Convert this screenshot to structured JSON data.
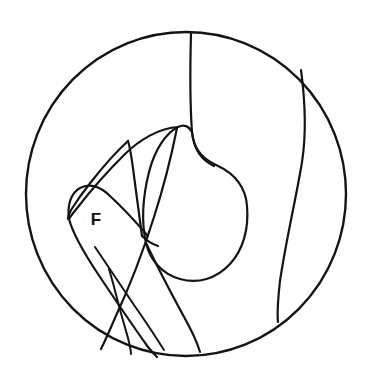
{
  "figure": {
    "type": "line-diagram",
    "background_color": "#ffffff",
    "stroke_color": "#141414",
    "canvas": {
      "width": 374,
      "height": 375
    }
  },
  "boundary": {
    "name": "field-of-view-circle",
    "shape": "ellipse",
    "center_x": 186,
    "center_y": 194,
    "radius_x": 160,
    "radius_y": 162,
    "stroke_width": 2.4
  },
  "labels": [
    {
      "id": "label-f",
      "text": "F",
      "x": 96,
      "y": 221,
      "font_size": 17,
      "font_weight": "bold",
      "color": "#111111"
    }
  ],
  "strokes": [
    {
      "id": "upper-vertical-divider",
      "description": "line descending from top of circle curving right",
      "stroke_width": 2.2,
      "d": "M 191 33 C 190 70, 190 105, 192 132 C 194 152, 203 161, 214 166"
    },
    {
      "id": "central-blob",
      "description": "large closed rounded mass in center of field",
      "stroke_width": 2.2,
      "d": "M 192 132 C 194 152, 205 160, 218 166 C 236 174, 246 189, 247 206 C 249 229, 243 250, 230 264 C 216 279, 198 284, 180 279 C 162 274, 150 260, 146 243 C 141 221, 143 196, 149 172 C 155 149, 166 133, 178 127 C 184 124, 189 126, 192 132 Z"
    },
    {
      "id": "right-boundary-curve",
      "description": "long curve from upper-right rim sweeping down and ending free",
      "stroke_width": 2.2,
      "d": "M 301 70 C 305 100, 307 130, 302 162 C 296 199, 286 240, 280 281 C 278 299, 277 313, 278 322"
    },
    {
      "id": "flap-outer-edge",
      "description": "outer long curve of the pointed leaflet/flap on the left",
      "stroke_width": 2.2,
      "d": "M 178 127 C 160 128, 140 139, 124 155 C 104 175, 88 194, 78 207 C 73 213, 70 217, 69 219"
    },
    {
      "id": "flap-inner-edge",
      "description": "inner line of pointed leaflet forming narrow wedge",
      "stroke_width": 2.2,
      "d": "M 128 141 C 116 152, 102 168, 91 182 C 83 192, 76 202, 71 210 C 69 214, 68 217, 68 219"
    },
    {
      "id": "flap-tip-ridge",
      "description": "short ridge closing the narrow wedge tip at upper area",
      "stroke_width": 2.2,
      "d": "M 128 141 C 130 147, 132 160, 134 176 C 137 199, 140 221, 142 236"
    },
    {
      "id": "blade-long-spine",
      "description": "long straight spine from leaflet root down to lower rim",
      "stroke_width": 2.2,
      "d": "M 177 128 C 172 153, 164 186, 154 217 C 143 252, 128 290, 115 318 C 109 332, 104 343, 101 349"
    },
    {
      "id": "probe-upper-edge",
      "description": "rounded probe/instrument upper-left rounded end",
      "stroke_width": 2.2,
      "d": "M 69 219 C 67 205, 71 193, 80 188 C 89 183, 100 186, 110 196 C 121 206, 135 221, 148 236"
    },
    {
      "id": "probe-lower-edge",
      "description": "lower edge of probe running diagonally to bottom rim",
      "stroke_width": 2.2,
      "d": "M 69 219 C 73 234, 84 253, 98 274 C 114 298, 133 326, 148 347 C 152 352, 155 355, 157 357"
    },
    {
      "id": "probe-mid-line",
      "description": "inner parallel line along probe shaft",
      "stroke_width": 2.0,
      "d": "M 95 247 C 105 262, 119 283, 134 305 C 146 322, 157 339, 164 350"
    },
    {
      "id": "probe-cross-tick",
      "description": "short tick joining the two probe shaft lines",
      "stroke_width": 2.0,
      "d": "M 109 269 L 113 283"
    },
    {
      "id": "probe-tail-line",
      "description": "line continuing from cross tick down to circle bottom rim",
      "stroke_width": 2.0,
      "d": "M 113 283 C 117 299, 123 321, 128 338 C 130 346, 131 351, 131 354"
    },
    {
      "id": "blade-far-edge",
      "description": "outer straight edge of blade meeting bottom rim on the right",
      "stroke_width": 2.2,
      "d": "M 146 243 C 155 262, 170 291, 183 315 C 192 331, 198 345, 200 352"
    },
    {
      "id": "blade-return-edge",
      "description": "short return edge from blade tip back toward the mass",
      "stroke_width": 2.2,
      "d": "M 142 236 C 146 240, 152 244, 158 246"
    }
  ]
}
